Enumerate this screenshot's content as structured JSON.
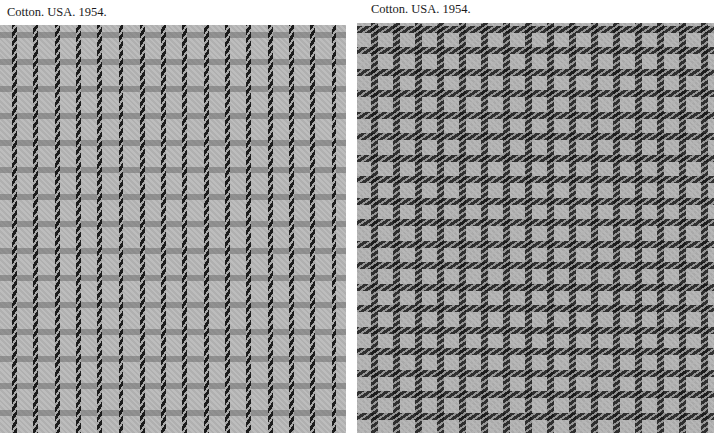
{
  "panels": [
    {
      "caption": "Cotton. USA. 1954.",
      "description": "Light gray cotton fabric with evenly spaced vertical black twill stripes and faint gray horizontal crossbars forming a subtle check",
      "colors": {
        "ground": "#b9b9b9",
        "stripe": "#141414",
        "crossbar": "#6e6e6e"
      }
    },
    {
      "caption": "Cotton. USA. 1954.",
      "description": "Light gray cotton fabric with a black twill windowpane / gingham-style check grid",
      "colors": {
        "ground": "#b4b4b4",
        "grid": "#191919"
      }
    }
  ]
}
